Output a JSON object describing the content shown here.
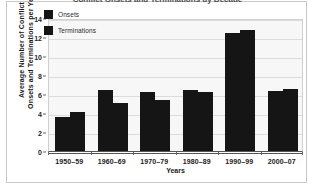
{
  "figure": {
    "clipped_title": "Conflict Onsets and Terminations by Decade"
  },
  "legend": {
    "position": "inside-top-left",
    "items": [
      {
        "label": "Onsets",
        "color": "#151515",
        "icon": "square-swatch-icon"
      },
      {
        "label": "Terminations",
        "color": "#151515",
        "icon": "square-swatch-icon"
      }
    ]
  },
  "axes": {
    "y_title_line1": "Average Number of Conflict",
    "y_title_line2": "Onsets and Terminations per Year",
    "x_title": "Years",
    "y_ticks": [
      "0",
      "2",
      "4",
      "6",
      "8",
      "10",
      "12",
      "14"
    ]
  },
  "chart_data": {
    "type": "bar",
    "title": "Conflict Onsets and Terminations by Decade",
    "xlabel": "Years",
    "ylabel": "Average Number of Conflict Onsets and Terminations per Year",
    "categories": [
      "1950–59",
      "1960–69",
      "1970–79",
      "1980–89",
      "1990–99",
      "2000–07"
    ],
    "series": [
      {
        "name": "Onsets",
        "color": "#151515",
        "values": [
          3.6,
          6.4,
          6.25,
          6.45,
          12.4,
          6.3
        ]
      },
      {
        "name": "Terminations",
        "color": "#151515",
        "values": [
          4.1,
          5.1,
          5.35,
          6.25,
          12.7,
          6.5
        ]
      }
    ],
    "ylim": [
      0,
      14
    ],
    "ytick_step": 2,
    "grid": true,
    "grid_axis": "y",
    "legend_position": "upper left inside",
    "plot_background": "#f7f7f7",
    "gridline_color": "#dcdcdc"
  }
}
